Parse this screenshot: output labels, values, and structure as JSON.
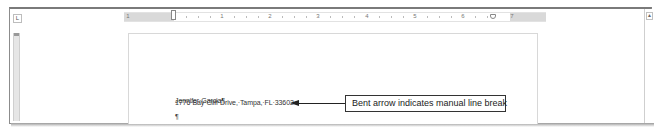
{
  "window": {
    "tab_selector_glyph": "L"
  },
  "ruler": {
    "numbers": [
      {
        "label": "1",
        "x": 222
      },
      {
        "label": "2",
        "x": 270
      },
      {
        "label": "3",
        "x": 318
      },
      {
        "label": "4",
        "x": 367
      },
      {
        "label": "5",
        "x": 415
      },
      {
        "label": "6",
        "x": 463
      },
      {
        "label": "7",
        "x": 512
      }
    ],
    "left_label": "1"
  },
  "document": {
    "lines": [
      {
        "text": "Jennifer·Garcia¶",
        "top": 97
      },
      {
        "text": "1776·Bay·Cliff·Drive,·Tampa,·FL·33602↵",
        "top": 99
      },
      {
        "text": "¶",
        "top": 113
      }
    ],
    "name_line": "Jennifer·Garcia¶",
    "address_line": "1776·Bay·Cliff·Drive,·Tampa,·FL·33602↵",
    "empty_paragraph": "¶"
  },
  "annotation": {
    "callout_text": "Bent arrow indicates manual line break",
    "arrow_color": "#222222"
  },
  "scrollbar": {
    "up_arrow_glyph": "▲"
  }
}
